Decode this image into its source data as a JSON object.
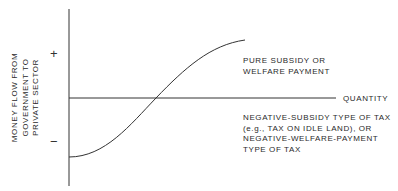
{
  "diagram": {
    "y_axis_label": [
      "MONEY FLOW FROM",
      "GOVERNMENT TO",
      "PRIVATE SECTOR"
    ],
    "x_axis_label": "QUANTITY",
    "positive_sign": "+",
    "negative_sign": "−",
    "upper_region_label": [
      "PURE SUBSIDY OR",
      "WELFARE PAYMENT"
    ],
    "lower_region_label": [
      "NEGATIVE-SUBSIDY TYPE OF TAX",
      "(e.g., TAX ON IDLE LAND), OR",
      "NEGATIVE-WELFARE-PAYMENT",
      "TYPE OF TAX"
    ],
    "colors": {
      "line": "#333333",
      "background": "#ffffff"
    }
  }
}
